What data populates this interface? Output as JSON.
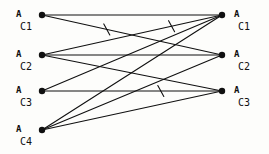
{
  "figure": {
    "title": "",
    "background": "#fdfdfb",
    "ink_color": "#101010",
    "width": 269,
    "height": 154
  },
  "chart_data": {
    "type": "diagram",
    "subtype": "bipartite-graph",
    "title": "",
    "xlabel": "",
    "ylabel": "",
    "grid": false,
    "legend": null,
    "node_radius": 3.2,
    "edge_width": 1.1,
    "columns": [
      {
        "side": "left",
        "x": 42
      },
      {
        "side": "right",
        "x": 222
      }
    ],
    "nodes": [
      {
        "id": "L1",
        "side": "left",
        "x": 42,
        "y": 15,
        "label_a": "A",
        "label_c": "C1"
      },
      {
        "id": "L2",
        "side": "left",
        "x": 42,
        "y": 55,
        "label_a": "A",
        "label_c": "C2"
      },
      {
        "id": "L3",
        "side": "left",
        "x": 42,
        "y": 91,
        "label_a": "A",
        "label_c": "C3"
      },
      {
        "id": "L4",
        "side": "left",
        "x": 42,
        "y": 130,
        "label_a": "A",
        "label_c": "C4"
      },
      {
        "id": "R1",
        "side": "right",
        "x": 222,
        "y": 15,
        "label_a": "A",
        "label_c": "C1"
      },
      {
        "id": "R2",
        "side": "right",
        "x": 222,
        "y": 55,
        "label_a": "A",
        "label_c": "C2"
      },
      {
        "id": "R3",
        "side": "right",
        "x": 222,
        "y": 91,
        "label_a": "A",
        "label_c": "C3"
      }
    ],
    "edges": [
      {
        "from": "L1",
        "to": "R1",
        "tick": false
      },
      {
        "from": "L1",
        "to": "R2",
        "tick": true,
        "tick_t": 0.36
      },
      {
        "from": "L2",
        "to": "R2",
        "tick": false
      },
      {
        "from": "L2",
        "to": "R3",
        "tick": false
      },
      {
        "from": "L3",
        "to": "R3",
        "tick": true,
        "tick_t": 0.66
      },
      {
        "from": "L3",
        "to": "R1",
        "tick": false
      },
      {
        "from": "L4",
        "to": "R1",
        "tick": false
      },
      {
        "from": "L4",
        "to": "R2",
        "tick": false
      },
      {
        "from": "L4",
        "to": "R3",
        "tick": false
      },
      {
        "from": "L2",
        "to": "R1",
        "tick": true,
        "tick_t": 0.72
      }
    ],
    "labels": {
      "left_a": [
        "A",
        "A",
        "A",
        "A"
      ],
      "left_c": [
        "C1",
        "C2",
        "C3",
        "C4"
      ],
      "right_a": [
        "A",
        "A",
        "A"
      ],
      "right_c": [
        "C1",
        "C2",
        "C3"
      ]
    }
  }
}
